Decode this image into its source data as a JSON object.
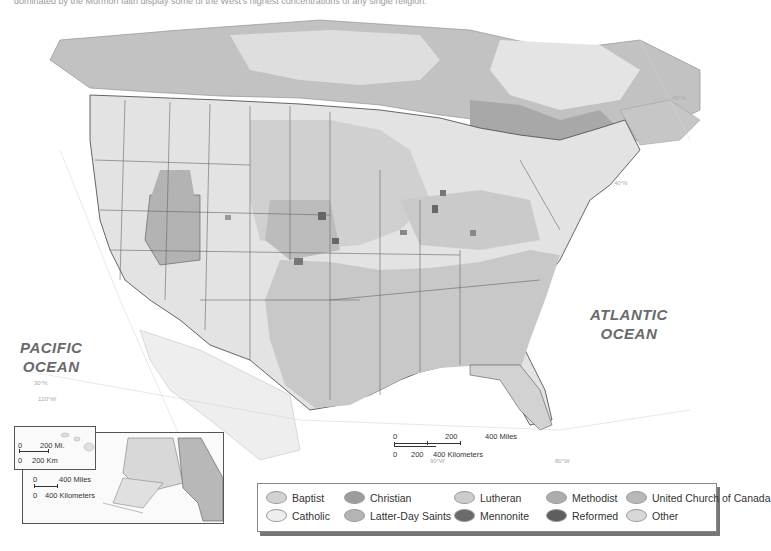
{
  "caption": "dominated by the Mormon faith display some of the West's highest concentrations of any single religion.",
  "map": {
    "type": "religion-distribution-map",
    "oceans": [
      {
        "name": "PACIFIC\nOCEAN",
        "line1": "PACIFIC",
        "line2": "OCEAN"
      },
      {
        "name": "ATLANTIC\nOCEAN",
        "line1": "ATLANTIC",
        "line2": "OCEAN"
      }
    ],
    "graticule_labels": [
      "45°N",
      "40°N",
      "35°N",
      "30°N",
      "25°N",
      "120°W",
      "115°W",
      "95°W",
      "90°W",
      "85°W",
      "80°W",
      "75°W",
      "70°W",
      "65°W",
      "60°W",
      "160°W",
      "150°W",
      "140°W",
      "22°N",
      "180°"
    ],
    "colors": {
      "canada_bg": "#b9b9b9",
      "us_light": "#e6e6e6",
      "us_mid": "#c4c4c4",
      "dark": "#777777",
      "border": "#555555"
    }
  },
  "scale_main": {
    "miles_labels": [
      "0",
      "200",
      "400 Miles"
    ],
    "km_labels": [
      "0",
      "200",
      "400 Kilometers"
    ]
  },
  "inset_hawaii": {
    "miles_labels": [
      "0",
      "200 Mi."
    ],
    "km_labels": [
      "0",
      "200 Km"
    ]
  },
  "inset_alaska": {
    "miles_labels": [
      "0",
      "400 Miles"
    ],
    "km_labels": [
      "0",
      "400 Kilometers"
    ]
  },
  "legend": {
    "items": [
      {
        "label": "Baptist",
        "color": "#d2d2d2"
      },
      {
        "label": "Christian",
        "color": "#9c9c9c"
      },
      {
        "label": "Lutheran",
        "color": "#cccccc"
      },
      {
        "label": "Methodist",
        "color": "#adadad"
      },
      {
        "label": "United Church of Canada",
        "color": "#b8b8b8"
      },
      {
        "label": "Catholic",
        "color": "#eeeeee"
      },
      {
        "label": "Latter-Day Saints",
        "color": "#b4b4b4"
      },
      {
        "label": "Mennonite",
        "color": "#6a6a6a"
      },
      {
        "label": "Reformed",
        "color": "#5e5e5e"
      },
      {
        "label": "Other",
        "color": "#d8d8d8"
      }
    ]
  }
}
